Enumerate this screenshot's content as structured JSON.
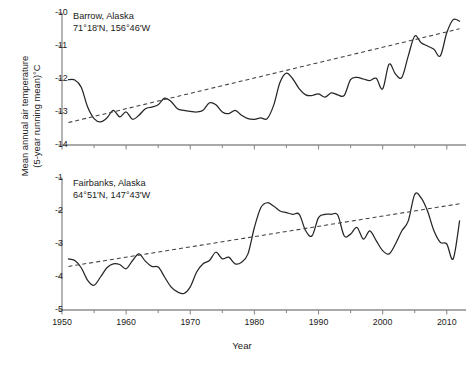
{
  "figure": {
    "ylabel_line1": "Mean annual air temperature",
    "ylabel_line2": "(5-year running mean)°C",
    "xlabel": "Year"
  },
  "chart_data": [
    {
      "type": "line",
      "title": "Barrow, Alaska",
      "subtitle": "71°18'N, 156°46'W",
      "xlabel": "Year",
      "ylabel": "Mean annual air temperature (5-year running mean)°C",
      "xlim": [
        1950,
        2013
      ],
      "ylim": [
        -14,
        -10
      ],
      "xticks": [
        1950,
        1960,
        1970,
        1980,
        1990,
        2000,
        2010
      ],
      "xtick_labels": [
        "1950",
        "1960",
        "1970",
        "1980",
        "1990",
        "2000",
        "2010"
      ],
      "xminor_interval": 5,
      "yticks": [
        -10,
        -11,
        -12,
        -13,
        -14
      ],
      "ytick_labels": [
        "-10",
        "-11",
        "-12",
        "-13",
        "-14"
      ],
      "grid": false,
      "legend": null,
      "series": [
        {
          "name": "5-year running mean air temperature",
          "style": "solid",
          "x": [
            1951,
            1952,
            1953,
            1954,
            1955,
            1956,
            1957,
            1958,
            1959,
            1960,
            1961,
            1962,
            1963,
            1964,
            1965,
            1966,
            1967,
            1968,
            1969,
            1970,
            1971,
            1972,
            1973,
            1974,
            1975,
            1976,
            1977,
            1978,
            1979,
            1980,
            1981,
            1982,
            1983,
            1984,
            1985,
            1986,
            1987,
            1988,
            1989,
            1990,
            1991,
            1992,
            1993,
            1994,
            1995,
            1996,
            1997,
            1998,
            1999,
            2000,
            2001,
            2002,
            2003,
            2004,
            2005,
            2006,
            2007,
            2008,
            2009,
            2010,
            2011,
            2012
          ],
          "values": [
            -12.02,
            -12.03,
            -12.25,
            -12.85,
            -13.2,
            -13.3,
            -13.18,
            -12.95,
            -13.15,
            -13.0,
            -13.22,
            -13.1,
            -12.9,
            -12.85,
            -12.78,
            -12.58,
            -12.68,
            -12.9,
            -12.95,
            -12.98,
            -13.0,
            -12.95,
            -12.72,
            -12.78,
            -13.0,
            -13.05,
            -12.95,
            -13.1,
            -13.2,
            -13.22,
            -13.18,
            -13.2,
            -12.8,
            -12.1,
            -11.82,
            -12.0,
            -12.3,
            -12.48,
            -12.5,
            -12.45,
            -12.55,
            -12.42,
            -12.48,
            -12.5,
            -12.02,
            -11.95,
            -12.0,
            -12.05,
            -11.98,
            -12.3,
            -11.55,
            -11.85,
            -11.95,
            -11.3,
            -10.7,
            -10.9,
            -11.0,
            -11.1,
            -11.3,
            -10.6,
            -10.2,
            -10.25
          ]
        },
        {
          "name": "Linear trend",
          "style": "dashed",
          "x": [
            1951,
            2012
          ],
          "values": [
            -13.32,
            -10.48
          ]
        }
      ]
    },
    {
      "type": "line",
      "title": "Fairbanks, Alaska",
      "subtitle": "64°51'N, 147°43'W",
      "xlabel": "Year",
      "ylabel": "Mean annual air temperature (5-year running mean)°C",
      "xlim": [
        1950,
        2013
      ],
      "ylim": [
        -5,
        -1
      ],
      "xticks": [
        1950,
        1960,
        1970,
        1980,
        1990,
        2000,
        2010
      ],
      "xtick_labels": [
        "1950",
        "1960",
        "1970",
        "1980",
        "1990",
        "2000",
        "2010"
      ],
      "xminor_interval": 5,
      "yticks": [
        -1,
        -2,
        -3,
        -4,
        -5
      ],
      "ytick_labels": [
        "-1",
        "-2",
        "-3",
        "-4",
        "-5"
      ],
      "grid": false,
      "legend": null,
      "series": [
        {
          "name": "5-year running mean air temperature",
          "style": "solid",
          "x": [
            1951,
            1952,
            1953,
            1954,
            1955,
            1956,
            1957,
            1958,
            1959,
            1960,
            1961,
            1962,
            1963,
            1964,
            1965,
            1966,
            1967,
            1968,
            1969,
            1970,
            1971,
            1972,
            1973,
            1974,
            1975,
            1976,
            1977,
            1978,
            1979,
            1980,
            1981,
            1982,
            1983,
            1984,
            1985,
            1986,
            1987,
            1988,
            1989,
            1990,
            1991,
            1992,
            1993,
            1994,
            1995,
            1996,
            1997,
            1998,
            1999,
            2000,
            2001,
            2002,
            2003,
            2004,
            2005,
            2006,
            2007,
            2008,
            2009,
            2010,
            2011,
            2012
          ],
          "values": [
            -3.45,
            -3.5,
            -3.72,
            -4.1,
            -4.25,
            -4.0,
            -3.72,
            -3.6,
            -3.62,
            -3.75,
            -3.5,
            -3.3,
            -3.52,
            -3.68,
            -3.7,
            -4.0,
            -4.3,
            -4.45,
            -4.5,
            -4.3,
            -3.85,
            -3.6,
            -3.5,
            -3.25,
            -3.45,
            -3.4,
            -3.6,
            -3.55,
            -3.3,
            -2.5,
            -1.9,
            -1.75,
            -1.85,
            -2.0,
            -2.05,
            -2.1,
            -2.1,
            -2.6,
            -2.75,
            -2.2,
            -2.1,
            -2.1,
            -2.12,
            -2.75,
            -2.7,
            -2.5,
            -2.85,
            -2.6,
            -2.9,
            -3.2,
            -3.3,
            -3.0,
            -2.6,
            -2.3,
            -1.5,
            -1.6,
            -2.0,
            -2.6,
            -2.95,
            -3.0,
            -3.45,
            -2.3
          ]
        },
        {
          "name": "Linear trend",
          "style": "dashed",
          "x": [
            1951,
            2012
          ],
          "values": [
            -3.68,
            -1.78
          ]
        }
      ]
    }
  ]
}
